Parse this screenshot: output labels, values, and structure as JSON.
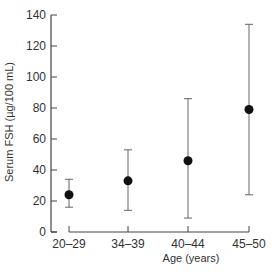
{
  "chart_data": {
    "type": "scatter",
    "subtype": "mean_with_range_error_bars",
    "title": "",
    "xlabel": "Age (years)",
    "ylabel": "Serum FSH (µg/100 mL)",
    "categories": [
      "20-29",
      "34-39",
      "40-44",
      "45-50"
    ],
    "series": [
      {
        "name": "Serum FSH",
        "values": [
          24,
          33,
          46,
          79
        ],
        "error_low": [
          16,
          14,
          9,
          24
        ],
        "error_high": [
          34,
          53,
          86,
          134
        ]
      }
    ],
    "ylim": [
      0,
      140
    ],
    "yticks": [
      0,
      20,
      40,
      60,
      80,
      100,
      120,
      140
    ],
    "grid": false,
    "legend": "none",
    "colors": {
      "axis": "#444444",
      "marker": "#111111",
      "errorbar": "#666666"
    }
  },
  "labels": {
    "ylabel": "Serum FSH (µg/100 mL)",
    "xlabel": "Age (years)"
  }
}
